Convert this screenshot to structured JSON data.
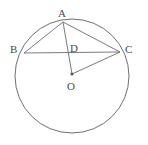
{
  "figure": {
    "canvas": {
      "width": 148,
      "height": 145
    },
    "style": {
      "background_color": "#ffffff",
      "stroke_color": "#6b6b6b",
      "circle_stroke_color": "#5f5f5f",
      "label_color": "#4a4a4a",
      "stroke_width": 0.9,
      "label_font_size": 11
    },
    "circle": {
      "name": "circle-O",
      "center_x": 72,
      "center_y": 76,
      "radius": 57
    },
    "points": [
      {
        "id": "A",
        "label": "A",
        "x": 63,
        "y": 22,
        "label_x": 58,
        "label_y": 8,
        "dot": false
      },
      {
        "id": "B",
        "label": "B",
        "x": 24,
        "y": 53,
        "label_x": 10,
        "label_y": 44,
        "dot": false
      },
      {
        "id": "C",
        "label": "C",
        "x": 120,
        "y": 52,
        "label_x": 125,
        "label_y": 44,
        "dot": false
      },
      {
        "id": "D",
        "label": "D",
        "x": 67,
        "y": 53,
        "label_x": 70,
        "label_y": 43,
        "dot": false
      },
      {
        "id": "O",
        "label": "O",
        "x": 72,
        "y": 74,
        "label_x": 67,
        "label_y": 81,
        "dot": true
      }
    ],
    "segments": [
      {
        "id": "AB",
        "from": "A",
        "to": "B",
        "x1": 63,
        "y1": 22,
        "x2": 24,
        "y2": 53
      },
      {
        "id": "AC",
        "from": "A",
        "to": "C",
        "x1": 63,
        "y1": 22,
        "x2": 120,
        "y2": 52
      },
      {
        "id": "BC",
        "from": "B",
        "to": "C",
        "x1": 24,
        "y1": 53,
        "x2": 120,
        "y2": 52
      },
      {
        "id": "AO",
        "from": "A",
        "to": "O",
        "x1": 63,
        "y1": 22,
        "x2": 72,
        "y2": 74
      },
      {
        "id": "OC",
        "from": "O",
        "to": "C",
        "x1": 72,
        "y1": 74,
        "x2": 120,
        "y2": 52
      }
    ],
    "center_dot": {
      "x": 72,
      "y": 74,
      "r": 1.6
    }
  }
}
